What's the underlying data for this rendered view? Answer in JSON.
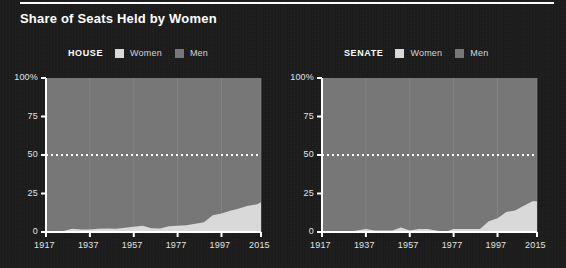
{
  "page": {
    "title": "Share of Seats Held by Women",
    "background_color": "#1b1b1b",
    "rule_color": "#ffffff"
  },
  "colors": {
    "women": "#d9d9d9",
    "men": "#777777",
    "axis": "#ffffff",
    "gridline": "#8d8d8d",
    "reference_line": "#ffffff",
    "text": "#e2e2e2"
  },
  "legends": {
    "house": {
      "title": "HOUSE",
      "entries": [
        {
          "label": "Women",
          "color": "#d9d9d9",
          "swatch": "women-swatch"
        },
        {
          "label": "Men",
          "color": "#777777",
          "swatch": "men-swatch"
        }
      ]
    },
    "senate": {
      "title": "SENATE",
      "entries": [
        {
          "label": "Women",
          "color": "#d9d9d9",
          "swatch": "women-swatch"
        },
        {
          "label": "Men",
          "color": "#777777",
          "swatch": "men-swatch"
        }
      ]
    }
  },
  "axes": {
    "y_ticks": [
      "100%",
      "75",
      "50",
      "25",
      "0"
    ],
    "y_values": [
      100,
      75,
      50,
      25,
      0
    ],
    "x_ticks": [
      "1917",
      "1937",
      "1957",
      "1977",
      "1997",
      "2015"
    ],
    "x_values": [
      1917,
      1937,
      1957,
      1977,
      1997,
      2015
    ],
    "reference_value": 50
  },
  "chart_data": [
    {
      "type": "area",
      "title": "HOUSE",
      "subtitle": "Share of Seats Held by Women",
      "xlabel": "",
      "ylabel": "",
      "xlim": [
        1917,
        2015
      ],
      "ylim": [
        0,
        100
      ],
      "grid": true,
      "legend_position": "top",
      "stacked": true,
      "reference_line": {
        "value": 50,
        "style": "dotted",
        "color": "#ffffff"
      },
      "x": [
        1917,
        1921,
        1925,
        1929,
        1933,
        1937,
        1941,
        1945,
        1949,
        1953,
        1957,
        1961,
        1965,
        1969,
        1973,
        1977,
        1981,
        1985,
        1989,
        1993,
        1997,
        2001,
        2005,
        2009,
        2013,
        2015
      ],
      "series": [
        {
          "name": "Women",
          "color": "#d9d9d9",
          "values": [
            0.2,
            0.7,
            0.7,
            2.1,
            1.6,
            1.6,
            2.1,
            2.3,
            2.1,
            2.8,
            3.4,
            4.1,
            2.5,
            2.3,
            3.7,
            4.1,
            4.4,
            5.3,
            6.4,
            10.8,
            12.0,
            13.8,
            15.2,
            17.0,
            17.9,
            19.3
          ]
        },
        {
          "name": "Men",
          "color": "#777777",
          "values": [
            99.8,
            99.3,
            99.3,
            97.9,
            98.4,
            98.4,
            97.9,
            97.7,
            97.9,
            97.2,
            96.6,
            95.9,
            97.5,
            97.7,
            96.3,
            95.9,
            95.6,
            94.7,
            93.6,
            89.2,
            88.0,
            86.2,
            84.8,
            83.0,
            82.1,
            80.7
          ]
        }
      ]
    },
    {
      "type": "area",
      "title": "SENATE",
      "subtitle": "Share of Seats Held by Women",
      "xlabel": "",
      "ylabel": "",
      "xlim": [
        1917,
        2015
      ],
      "ylim": [
        0,
        100
      ],
      "grid": true,
      "legend_position": "top",
      "stacked": true,
      "reference_line": {
        "value": 50,
        "style": "dotted",
        "color": "#ffffff"
      },
      "x": [
        1917,
        1921,
        1925,
        1929,
        1933,
        1937,
        1941,
        1945,
        1949,
        1953,
        1957,
        1961,
        1965,
        1969,
        1973,
        1977,
        1981,
        1985,
        1989,
        1993,
        1997,
        2001,
        2005,
        2009,
        2013,
        2015
      ],
      "series": [
        {
          "name": "Women",
          "color": "#d9d9d9",
          "values": [
            0.0,
            0.0,
            0.0,
            0.0,
            1.0,
            2.0,
            1.0,
            1.0,
            1.0,
            3.0,
            1.0,
            2.0,
            2.0,
            1.0,
            0.0,
            2.0,
            2.0,
            2.0,
            2.0,
            7.0,
            9.0,
            13.0,
            14.0,
            17.0,
            20.0,
            20.0
          ]
        },
        {
          "name": "Men",
          "color": "#777777",
          "values": [
            100.0,
            100.0,
            100.0,
            100.0,
            99.0,
            98.0,
            99.0,
            99.0,
            99.0,
            97.0,
            99.0,
            98.0,
            98.0,
            99.0,
            100.0,
            98.0,
            98.0,
            98.0,
            98.0,
            93.0,
            91.0,
            87.0,
            86.0,
            83.0,
            80.0,
            80.0
          ]
        }
      ]
    }
  ]
}
